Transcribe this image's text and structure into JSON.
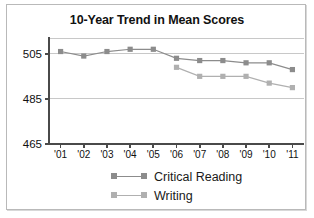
{
  "chart_data": {
    "type": "line",
    "title": "10-Year Trend in Mean Scores",
    "xlabel": "",
    "ylabel": "",
    "categories": [
      "'01",
      "'02",
      "'03",
      "'04",
      "'05",
      "'06",
      "'07",
      "'08",
      "'09",
      "'10",
      "'11"
    ],
    "yticks": [
      465,
      485,
      505
    ],
    "ylim": [
      465,
      512
    ],
    "grid": true,
    "legend_position": "bottom",
    "series": [
      {
        "name": "Critical Reading",
        "color": "#8c8c8c",
        "values": [
          506,
          504,
          506,
          507,
          507,
          503,
          502,
          502,
          501,
          501,
          498
        ]
      },
      {
        "name": "Writing",
        "color": "#b0b0b0",
        "values": [
          null,
          null,
          null,
          null,
          null,
          499,
          495,
          495,
          495,
          492,
          490
        ]
      }
    ]
  },
  "chart": {
    "title": "10-Year Trend in Mean Scores"
  },
  "legend": {
    "items": [
      {
        "label": "Critical Reading"
      },
      {
        "label": "Writing"
      }
    ]
  },
  "colors": {
    "critical_reading": "#8c8c8c",
    "writing": "#b0b0b0",
    "axis": "#4a4a4a",
    "grid": "#c8c8c8",
    "text": "#111111",
    "frame": "#b9b9b9"
  }
}
